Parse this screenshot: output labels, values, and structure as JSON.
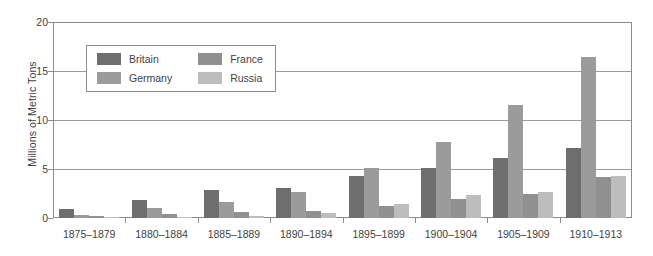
{
  "chart_data": {
    "type": "bar",
    "title": "",
    "subtitle": "",
    "xlabel": "",
    "ylabel": "Millions of Metric Tons",
    "ylim": [
      0,
      20
    ],
    "yticks": [
      0,
      5,
      10,
      15,
      20
    ],
    "grid": true,
    "grid_axis": "y",
    "legend_position": "inside-top-left",
    "categories": [
      "1875–1879",
      "1880–1884",
      "1885–1889",
      "1890–1894",
      "1895–1899",
      "1900–1904",
      "1905–1909",
      "1910–1913"
    ],
    "series": [
      {
        "name": "Britain",
        "color": "#6e6e6e",
        "values": [
          0.9,
          1.8,
          2.9,
          3.1,
          4.3,
          5.1,
          6.1,
          7.1
        ]
      },
      {
        "name": "Germany",
        "color": "#9b9b9b",
        "values": [
          0.3,
          1.0,
          1.6,
          2.7,
          5.1,
          7.8,
          11.5,
          16.4
        ]
      },
      {
        "name": "France",
        "color": "#909090",
        "values": [
          0.2,
          0.45,
          0.6,
          0.7,
          1.2,
          1.9,
          2.5,
          4.2
        ]
      },
      {
        "name": "Russia",
        "color": "#bdbdbd",
        "values": [
          0.05,
          0.15,
          0.25,
          0.5,
          1.4,
          2.3,
          2.7,
          4.3
        ]
      }
    ]
  },
  "legend": {
    "entries": [
      {
        "label": "Britain",
        "color": "#6e6e6e"
      },
      {
        "label": "France",
        "color": "#909090"
      },
      {
        "label": "Germany",
        "color": "#9b9b9b"
      },
      {
        "label": "Russia",
        "color": "#bdbdbd"
      }
    ]
  }
}
